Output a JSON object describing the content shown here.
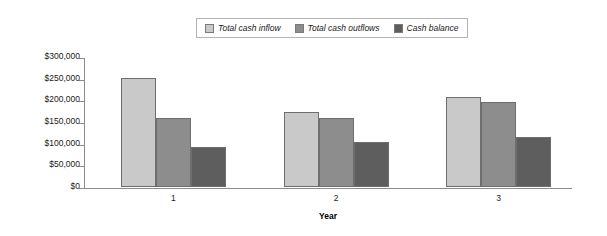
{
  "chart_data": {
    "type": "bar",
    "title": "",
    "xlabel": "Year",
    "ylabel": "",
    "categories": [
      "1",
      "2",
      "3"
    ],
    "series": [
      {
        "name": "Total cash inflow",
        "color": "#c9c9c9",
        "values": [
          252000,
          173000,
          208000
        ]
      },
      {
        "name": "Total cash outflows",
        "color": "#8d8d8d",
        "values": [
          160000,
          160000,
          196000
        ]
      },
      {
        "name": "Cash balance",
        "color": "#5e5e5e",
        "values": [
          92000,
          103000,
          116000
        ]
      }
    ],
    "ylim": [
      0,
      300000
    ],
    "y_tick_values": [
      300000,
      250000,
      200000,
      150000,
      100000,
      50000,
      0
    ],
    "y_tick_labels": [
      "$300,000",
      "$250,000",
      "$200,000",
      "$150,000",
      "$100,000",
      "$50,000",
      "$0"
    ],
    "grid": false,
    "legend_position": "top-center"
  },
  "legend": {
    "items": [
      {
        "label": "Total cash inflow",
        "color": "#c9c9c9"
      },
      {
        "label": "Total cash outflows",
        "color": "#8d8d8d"
      },
      {
        "label": "Cash balance",
        "color": "#5e5e5e"
      }
    ]
  },
  "axes": {
    "x_title": "Year",
    "x_labels": [
      "1",
      "2",
      "3"
    ],
    "y_labels": [
      "$300,000",
      "$250,000",
      "$200,000",
      "$150,000",
      "$100,000",
      "$50,000",
      "$0"
    ]
  }
}
